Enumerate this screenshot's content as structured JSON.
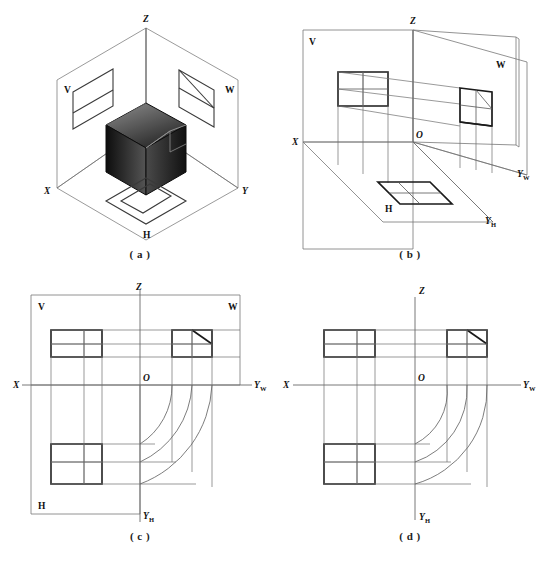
{
  "figure": {
    "background_color": "#ffffff",
    "line_color": "#333333",
    "accent_color": "#1a1a1a"
  },
  "panels": [
    {
      "id": "a",
      "caption": "( a )",
      "description": "Three mutually perpendicular projection planes forming an open box with the shaded solid suspended at the corner; the front (V), side (W) and top (H) projections appear on the planes.",
      "labels": {
        "z_axis": "Z",
        "x_axis": "X",
        "y_axis": "Y",
        "v_plane": "V",
        "w_plane": "W",
        "h_plane": "H"
      }
    },
    {
      "id": "b",
      "caption": "( b )",
      "description": "The W plane rotates about the OZ axis and the H plane rotates about the OX axis so that all three planes unfold into one drawing plane.",
      "labels": {
        "z_axis": "Z",
        "x_axis": "X",
        "origin": "O",
        "y_w_axis": "Y",
        "y_w_subscript": "W",
        "y_h_axis": "Y",
        "y_h_subscript": "H",
        "v_plane": "V",
        "w_plane": "W",
        "h_plane": "H"
      }
    },
    {
      "id": "c",
      "caption": "( c )",
      "description": "The unfolded three-view layout with plane outlines still shown; quarter-circle arcs centred on O transfer the depth dimension between the top view and the left side view.",
      "labels": {
        "z_axis": "Z",
        "x_axis": "X",
        "origin": "O",
        "y_w_axis": "Y",
        "y_w_subscript": "W",
        "y_h_axis": "Y",
        "y_h_subscript": "H",
        "v_plane": "V",
        "w_plane": "W",
        "h_plane": "H"
      }
    },
    {
      "id": "d",
      "caption": "( d )",
      "description": "The finished three-view drawing with the projection-plane borders removed, retaining only the axes, the three views and the depth transfer arcs.",
      "labels": {
        "z_axis": "Z",
        "x_axis": "X",
        "origin": "O",
        "y_w_axis": "Y",
        "y_w_subscript": "W",
        "y_h_axis": "Y",
        "y_h_subscript": "H"
      }
    }
  ],
  "views": {
    "front_view": {
      "name": "V projection (front view)",
      "features": "rectangle divided by one vertical line and one horizontal line"
    },
    "side_view": {
      "name": "W projection (left side view)",
      "features": "square divided by one vertical line and one horizontal line with a diagonal in the upper right cell"
    },
    "top_view": {
      "name": "H projection (top view)",
      "features": "rectangle divided by one vertical line and one horizontal line"
    }
  }
}
